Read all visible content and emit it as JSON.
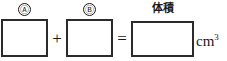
{
  "equation": {
    "description": "fill-in-the-blank volume equation worksheet",
    "terms": [
      {
        "id": "a",
        "circled_label": "Ⓐ",
        "value": ""
      },
      {
        "id": "b",
        "circled_label": "Ⓑ",
        "value": ""
      },
      {
        "id": "sum",
        "caption": "体積",
        "value": ""
      }
    ],
    "operators": {
      "plus": "+",
      "equals": "="
    },
    "unit": {
      "base": "cm",
      "exponent": "3"
    }
  },
  "colors": {
    "ink": "#1a1a1a",
    "box_border": "#2b2b2b",
    "background": "#ffffff"
  }
}
